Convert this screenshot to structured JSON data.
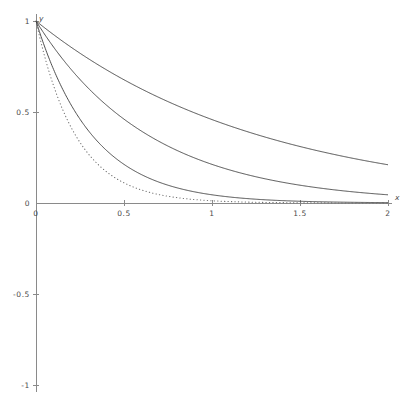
{
  "chart_data": {
    "type": "line",
    "title": "",
    "subtitle": "",
    "xlabel": "x",
    "ylabel": "y",
    "xlim": [
      0,
      2
    ],
    "ylim": [
      -1,
      1
    ],
    "grid": false,
    "legend": "none",
    "background_color": "#ffffff",
    "axis_color": "#8a8a8a",
    "curve_color": "#3c3c3c",
    "dotted_curve_color": "#6e6e6e",
    "x_ticks": [
      {
        "value": 0,
        "label": "0"
      },
      {
        "value": 0.5,
        "label": "0.5"
      },
      {
        "value": 1,
        "label": "1"
      },
      {
        "value": 1.5,
        "label": "1.5"
      },
      {
        "value": 2,
        "label": "2"
      }
    ],
    "y_ticks": [
      {
        "value": 1,
        "label": "1"
      },
      {
        "value": 0.5,
        "label": "0.5"
      },
      {
        "value": 0,
        "label": "0"
      },
      {
        "value": -0.5,
        "label": "-0.5"
      },
      {
        "value": -1,
        "label": "-1"
      }
    ],
    "series": [
      {
        "name": "curve-1",
        "style": "solid",
        "decay": 0.78,
        "x": [
          0,
          0.1,
          0.2,
          0.3,
          0.4,
          0.5,
          0.6,
          0.7,
          0.8,
          0.9,
          1,
          1.1,
          1.2,
          1.3,
          1.4,
          1.5,
          1.6,
          1.7,
          1.8,
          1.9,
          2
        ],
        "values": [
          1,
          0.925,
          0.855,
          0.791,
          0.732,
          0.677,
          0.626,
          0.579,
          0.535,
          0.495,
          0.458,
          0.424,
          0.392,
          0.363,
          0.335,
          0.31,
          0.287,
          0.265,
          0.246,
          0.227,
          0.21
        ]
      },
      {
        "name": "curve-2",
        "style": "solid",
        "decay": 1.55,
        "x": [
          0,
          0.1,
          0.2,
          0.3,
          0.4,
          0.5,
          0.6,
          0.7,
          0.8,
          0.9,
          1,
          1.1,
          1.2,
          1.3,
          1.4,
          1.5,
          1.6,
          1.7,
          1.8,
          1.9,
          2
        ],
        "values": [
          1,
          0.856,
          0.733,
          0.628,
          0.538,
          0.461,
          0.394,
          0.338,
          0.289,
          0.248,
          0.212,
          0.182,
          0.156,
          0.133,
          0.114,
          0.098,
          0.084,
          0.072,
          0.062,
          0.053,
          0.045
        ]
      },
      {
        "name": "curve-3",
        "style": "solid",
        "decay": 3.1,
        "x": [
          0,
          0.1,
          0.2,
          0.3,
          0.4,
          0.5,
          0.6,
          0.7,
          0.8,
          0.9,
          1,
          1.1,
          1.2,
          1.3,
          1.4,
          1.5,
          1.6,
          1.7,
          1.8,
          1.9,
          2
        ],
        "values": [
          1,
          0.733,
          0.538,
          0.394,
          0.289,
          0.212,
          0.156,
          0.114,
          0.084,
          0.061,
          0.045,
          0.033,
          0.024,
          0.018,
          0.013,
          0.0096,
          0.007,
          0.0051,
          0.0038,
          0.0028,
          0.002
        ]
      },
      {
        "name": "curve-4",
        "style": "dotted",
        "decay": 4.4,
        "x": [
          0,
          0.1,
          0.2,
          0.3,
          0.4,
          0.5,
          0.6,
          0.7,
          0.8,
          0.9,
          1,
          1.1,
          1.2,
          1.3,
          1.4,
          1.5,
          1.6,
          1.7,
          1.8,
          1.9,
          2
        ],
        "values": [
          1,
          0.644,
          0.415,
          0.268,
          0.172,
          0.111,
          0.071,
          0.046,
          0.03,
          0.019,
          0.012,
          0.0079,
          0.0051,
          0.0033,
          0.0021,
          0.0014,
          0.0009,
          0.0006,
          0.0004,
          0.00025,
          0.00015
        ]
      }
    ]
  },
  "geometry": {
    "origin_x_px": 36,
    "origin_y_px": 203,
    "px_per_x_unit": 176,
    "px_per_y_unit": 182,
    "y_axis_top_px": 14,
    "y_axis_bottom_px": 392,
    "x_axis_right_px": 392
  }
}
